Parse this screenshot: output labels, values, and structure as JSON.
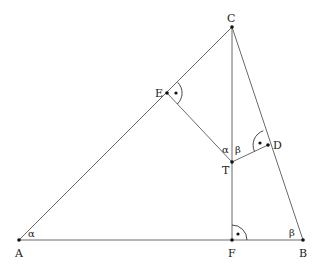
{
  "diagram": {
    "type": "geometry-triangle",
    "points": {
      "A": {
        "label": "A",
        "x": 19,
        "y": 240
      },
      "B": {
        "label": "B",
        "x": 303,
        "y": 240
      },
      "C": {
        "label": "C",
        "x": 232,
        "y": 27
      },
      "F": {
        "label": "F",
        "x": 232,
        "y": 240
      },
      "E": {
        "label": "E",
        "x": 167,
        "y": 93
      },
      "T": {
        "label": "T",
        "x": 232,
        "y": 162
      },
      "D": {
        "label": "D",
        "x": 268,
        "y": 145
      }
    },
    "segments": [
      [
        "A",
        "B"
      ],
      [
        "A",
        "C"
      ],
      [
        "B",
        "C"
      ],
      [
        "C",
        "F"
      ],
      [
        "E",
        "T"
      ],
      [
        "T",
        "D"
      ]
    ],
    "angle_labels": {
      "alpha_A": "α",
      "beta_B": "β",
      "alpha_T": "α",
      "beta_T": "β"
    },
    "right_angles": [
      "E",
      "D",
      "F"
    ],
    "colors": {
      "line": "#6b6b6b",
      "point": "#111111",
      "text": "#222222",
      "background": "#ffffff"
    }
  }
}
